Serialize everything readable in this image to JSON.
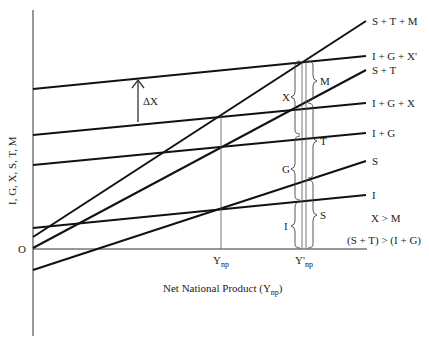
{
  "diagram": {
    "y_axis_label": "I, G, X, S, T, M",
    "x_axis_label": "Net National Product (Y",
    "x_axis_label_sub": "np",
    "x_axis_label_close": ")",
    "origin_label": "O",
    "tick_ynp": {
      "main": "Y",
      "sub": "np"
    },
    "tick_ynp_prime": {
      "main": "Y'",
      "sub": "np"
    },
    "shift_label": "ΔX",
    "lines": [
      {
        "name": "S + T + M",
        "x1": 33,
        "y1": 237,
        "x2": 366,
        "y2": 21
      },
      {
        "name": "I + G + X'",
        "x1": 33,
        "y1": 89,
        "x2": 366,
        "y2": 56
      },
      {
        "name": "S + T",
        "x1": 33,
        "y1": 248,
        "x2": 366,
        "y2": 70
      },
      {
        "name": "I + G + X",
        "x1": 33,
        "y1": 135,
        "x2": 366,
        "y2": 103
      },
      {
        "name": "I + G",
        "x1": 33,
        "y1": 165,
        "x2": 366,
        "y2": 133
      },
      {
        "name": "S",
        "x1": 33,
        "y1": 270,
        "x2": 366,
        "y2": 161
      },
      {
        "name": "I",
        "x1": 33,
        "y1": 228,
        "x2": 366,
        "y2": 195
      }
    ],
    "braces_left": [
      {
        "label": "X"
      },
      {
        "label": "G"
      },
      {
        "label": "I"
      }
    ],
    "braces_right": [
      {
        "label": "M"
      },
      {
        "label": "T"
      },
      {
        "label": "S"
      }
    ],
    "conditions": [
      "X > M",
      "(S + T) > (I + G)"
    ]
  }
}
